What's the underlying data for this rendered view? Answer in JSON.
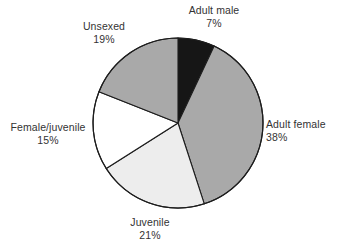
{
  "chart_data": {
    "type": "pie",
    "title": "",
    "subtitle": "",
    "xlabel": "",
    "ylabel": "",
    "legend_position": "none",
    "grid": false,
    "labels_outside": true,
    "value_unit": "%",
    "total": 100,
    "start_angle_deg": 0,
    "direction": "clockwise",
    "categories": [
      "Adult male",
      "Adult female",
      "Juvenile",
      "Female/juvenile",
      "Unsexed"
    ],
    "values": [
      7,
      38,
      21,
      15,
      19
    ],
    "colors": [
      "#161616",
      "#a9a9a9",
      "#ededed",
      "#ffffff",
      "#a9a9a9"
    ],
    "slices": [
      {
        "label": "Adult male",
        "value": 7,
        "value_text": "7%",
        "color": "#161616",
        "start_deg": 0,
        "end_deg": 25.2
      },
      {
        "label": "Adult female",
        "value": 38,
        "value_text": "38%",
        "color": "#a9a9a9",
        "start_deg": 25.2,
        "end_deg": 162.0
      },
      {
        "label": "Juvenile",
        "value": 21,
        "value_text": "21%",
        "color": "#ededed",
        "start_deg": 162.0,
        "end_deg": 237.6
      },
      {
        "label": "Female/juvenile",
        "value": 15,
        "value_text": "15%",
        "color": "#ffffff",
        "start_deg": 237.6,
        "end_deg": 291.6
      },
      {
        "label": "Unsexed",
        "value": 19,
        "value_text": "19%",
        "color": "#a9a9a9",
        "start_deg": 291.6,
        "end_deg": 360.0
      }
    ],
    "geometry": {
      "center_x": 178,
      "center_y": 123,
      "radius": 85,
      "outline_color": "#1d1d1d"
    }
  }
}
